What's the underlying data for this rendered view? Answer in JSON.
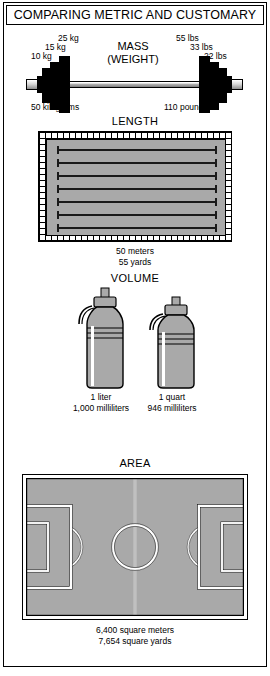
{
  "title": "COMPARING METRIC AND CUSTOMARY",
  "sections": {
    "mass": {
      "heading_line1": "MASS",
      "heading_line2": "(WEIGHT)",
      "metric_plate_labels": [
        "25 kg",
        "15 kg",
        "10 kg"
      ],
      "customary_plate_labels": [
        "55 lbs",
        "33 lbs",
        "22 lbs"
      ],
      "metric_total": "50 kilograms",
      "customary_total": "110 pounds"
    },
    "length": {
      "heading": "LENGTH",
      "metric_total": "50 meters",
      "customary_total": "55 yards",
      "lane_count": 7
    },
    "volume": {
      "heading": "VOLUME",
      "left_bottle": {
        "metric_total": "1 liter",
        "customary_total": "1,000 milliliters"
      },
      "right_bottle": {
        "metric_total": "1 quart",
        "customary_total": "946 milliliters"
      }
    },
    "area": {
      "heading": "AREA",
      "metric_total": "6,400 square meters",
      "customary_total": "7,654 square yards"
    }
  },
  "colors": {
    "ink": "#000000",
    "fill_gray": "#a9a9a9",
    "bottle_gray": "#a9a9a9",
    "field_gray": "#a9a9a9",
    "paper": "#ffffff"
  }
}
